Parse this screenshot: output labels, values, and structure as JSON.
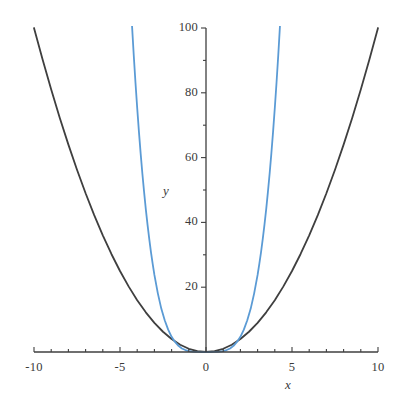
{
  "chart_data": {
    "type": "line",
    "title": "",
    "subtitle": "",
    "xlabel": "x",
    "ylabel": "y",
    "xlim": [
      -10,
      10
    ],
    "ylim": [
      0,
      100
    ],
    "grid": false,
    "legend": "none",
    "x_ticks": [
      {
        "value": -10,
        "label": "-10",
        "major": true
      },
      {
        "value": -9,
        "label": "",
        "major": false
      },
      {
        "value": -8,
        "label": "",
        "major": false
      },
      {
        "value": -7,
        "label": "",
        "major": false
      },
      {
        "value": -6,
        "label": "",
        "major": false
      },
      {
        "value": -5,
        "label": "-5",
        "major": true
      },
      {
        "value": -4,
        "label": "",
        "major": false
      },
      {
        "value": -3,
        "label": "",
        "major": false
      },
      {
        "value": -2,
        "label": "",
        "major": false
      },
      {
        "value": -1,
        "label": "",
        "major": false
      },
      {
        "value": 0,
        "label": "0",
        "major": true
      },
      {
        "value": 1,
        "label": "",
        "major": false
      },
      {
        "value": 2,
        "label": "",
        "major": false
      },
      {
        "value": 3,
        "label": "",
        "major": false
      },
      {
        "value": 4,
        "label": "",
        "major": false
      },
      {
        "value": 5,
        "label": "5",
        "major": true
      },
      {
        "value": 6,
        "label": "",
        "major": false
      },
      {
        "value": 7,
        "label": "",
        "major": false
      },
      {
        "value": 8,
        "label": "",
        "major": false
      },
      {
        "value": 9,
        "label": "",
        "major": false
      },
      {
        "value": 10,
        "label": "10",
        "major": true
      }
    ],
    "y_ticks": [
      {
        "value": 20,
        "label": "20",
        "major": true
      },
      {
        "value": 30,
        "label": "",
        "major": false
      },
      {
        "value": 40,
        "label": "40",
        "major": true
      },
      {
        "value": 50,
        "label": "",
        "major": false
      },
      {
        "value": 60,
        "label": "60",
        "major": true
      },
      {
        "value": 70,
        "label": "",
        "major": false
      },
      {
        "value": 80,
        "label": "80",
        "major": true
      },
      {
        "value": 90,
        "label": "",
        "major": false
      },
      {
        "value": 100,
        "label": "100",
        "major": true
      }
    ],
    "series": [
      {
        "name": "dark-parabola",
        "color": "#3f3f3f",
        "width": 1.8,
        "equation": "y = x^2",
        "points": [
          {
            "x": -10,
            "y": 100
          },
          {
            "x": -9.5,
            "y": 90.25
          },
          {
            "x": -9,
            "y": 81
          },
          {
            "x": -8.5,
            "y": 72.25
          },
          {
            "x": -8,
            "y": 64
          },
          {
            "x": -7.5,
            "y": 56.25
          },
          {
            "x": -7,
            "y": 49
          },
          {
            "x": -6.5,
            "y": 42.25
          },
          {
            "x": -6,
            "y": 36
          },
          {
            "x": -5.5,
            "y": 30.25
          },
          {
            "x": -5,
            "y": 25
          },
          {
            "x": -4.5,
            "y": 20.25
          },
          {
            "x": -4,
            "y": 16
          },
          {
            "x": -3.5,
            "y": 12.25
          },
          {
            "x": -3,
            "y": 9
          },
          {
            "x": -2.5,
            "y": 6.25
          },
          {
            "x": -2,
            "y": 4
          },
          {
            "x": -1.5,
            "y": 2.25
          },
          {
            "x": -1,
            "y": 1
          },
          {
            "x": -0.5,
            "y": 0.25
          },
          {
            "x": 0,
            "y": 0
          },
          {
            "x": 0.5,
            "y": 0.25
          },
          {
            "x": 1,
            "y": 1
          },
          {
            "x": 1.5,
            "y": 2.25
          },
          {
            "x": 2,
            "y": 4
          },
          {
            "x": 2.5,
            "y": 6.25
          },
          {
            "x": 3,
            "y": 9
          },
          {
            "x": 3.5,
            "y": 12.25
          },
          {
            "x": 4,
            "y": 16
          },
          {
            "x": 4.5,
            "y": 20.25
          },
          {
            "x": 5,
            "y": 25
          },
          {
            "x": 5.5,
            "y": 30.25
          },
          {
            "x": 6,
            "y": 36
          },
          {
            "x": 6.5,
            "y": 42.25
          },
          {
            "x": 7,
            "y": 49
          },
          {
            "x": 7.5,
            "y": 56.25
          },
          {
            "x": 8,
            "y": 64
          },
          {
            "x": 8.5,
            "y": 72.25
          },
          {
            "x": 9,
            "y": 81
          },
          {
            "x": 9.5,
            "y": 90.25
          },
          {
            "x": 10,
            "y": 100
          }
        ]
      },
      {
        "name": "blue-quartic",
        "color": "#5b9bd5",
        "width": 1.8,
        "equation": "y = x^4 / 3.4",
        "points": [
          {
            "x": -4.3,
            "y": 100.6
          },
          {
            "x": -4.2,
            "y": 91.5
          },
          {
            "x": -4.1,
            "y": 83.1
          },
          {
            "x": -4,
            "y": 75.3
          },
          {
            "x": -3.9,
            "y": 68.0
          },
          {
            "x": -3.8,
            "y": 61.3
          },
          {
            "x": -3.7,
            "y": 55.1
          },
          {
            "x": -3.6,
            "y": 49.4
          },
          {
            "x": -3.5,
            "y": 44.1
          },
          {
            "x": -3.4,
            "y": 39.3
          },
          {
            "x": -3.3,
            "y": 34.9
          },
          {
            "x": -3.2,
            "y": 30.8
          },
          {
            "x": -3.1,
            "y": 27.2
          },
          {
            "x": -3,
            "y": 23.8
          },
          {
            "x": -2.8,
            "y": 18.1
          },
          {
            "x": -2.6,
            "y": 13.4
          },
          {
            "x": -2.4,
            "y": 9.8
          },
          {
            "x": -2.2,
            "y": 6.9
          },
          {
            "x": -2,
            "y": 4.7
          },
          {
            "x": -1.8,
            "y": 3.1
          },
          {
            "x": -1.6,
            "y": 1.9
          },
          {
            "x": -1.4,
            "y": 1.1
          },
          {
            "x": -1.2,
            "y": 0.6
          },
          {
            "x": -1,
            "y": 0.3
          },
          {
            "x": -0.8,
            "y": 0.12
          },
          {
            "x": -0.6,
            "y": 0.04
          },
          {
            "x": -0.4,
            "y": 0.01
          },
          {
            "x": -0.2,
            "y": 0.0
          },
          {
            "x": 0,
            "y": 0
          },
          {
            "x": 0.2,
            "y": 0.0
          },
          {
            "x": 0.4,
            "y": 0.01
          },
          {
            "x": 0.6,
            "y": 0.04
          },
          {
            "x": 0.8,
            "y": 0.12
          },
          {
            "x": 1,
            "y": 0.3
          },
          {
            "x": 1.2,
            "y": 0.6
          },
          {
            "x": 1.4,
            "y": 1.1
          },
          {
            "x": 1.6,
            "y": 1.9
          },
          {
            "x": 1.8,
            "y": 3.1
          },
          {
            "x": 2,
            "y": 4.7
          },
          {
            "x": 2.2,
            "y": 6.9
          },
          {
            "x": 2.4,
            "y": 9.8
          },
          {
            "x": 2.6,
            "y": 13.4
          },
          {
            "x": 2.8,
            "y": 18.1
          },
          {
            "x": 3,
            "y": 23.8
          },
          {
            "x": 3.1,
            "y": 27.2
          },
          {
            "x": 3.2,
            "y": 30.8
          },
          {
            "x": 3.3,
            "y": 34.9
          },
          {
            "x": 3.4,
            "y": 39.3
          },
          {
            "x": 3.5,
            "y": 44.1
          },
          {
            "x": 3.6,
            "y": 49.4
          },
          {
            "x": 3.7,
            "y": 55.1
          },
          {
            "x": 3.8,
            "y": 61.3
          },
          {
            "x": 3.9,
            "y": 68.0
          },
          {
            "x": 4,
            "y": 75.3
          },
          {
            "x": 4.1,
            "y": 83.1
          },
          {
            "x": 4.2,
            "y": 91.5
          },
          {
            "x": 4.3,
            "y": 100.6
          }
        ]
      }
    ],
    "colors": {
      "axis": "#3f3f3f",
      "dark_curve": "#3f3f3f",
      "blue_curve": "#5b9bd5",
      "text": "#3a3a3a",
      "background": "#ffffff"
    }
  }
}
